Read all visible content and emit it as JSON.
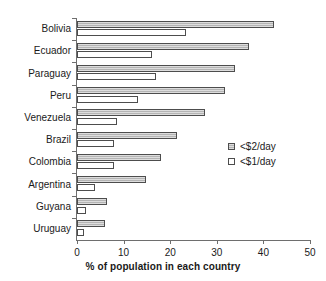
{
  "chart_data": {
    "type": "bar",
    "orientation": "horizontal",
    "title": "",
    "xlabel": "% of population in each country",
    "ylabel": "",
    "xlim": [
      0,
      50
    ],
    "xticks": [
      0,
      10,
      20,
      30,
      40,
      50
    ],
    "grid": false,
    "legend_position": "right-middle",
    "categories": [
      "Bolivia",
      "Ecuador",
      "Paraguay",
      "Peru",
      "Venezuela",
      "Brazil",
      "Colombia",
      "Argentina",
      "Guyana",
      "Uruguay"
    ],
    "series": [
      {
        "name": "<$2/day",
        "color": "#b4b4b4",
        "values": [
          42.3,
          37.0,
          34.0,
          31.8,
          27.5,
          21.5,
          18.0,
          14.8,
          6.5,
          6.0
        ]
      },
      {
        "name": "<$1/day",
        "color": "#ffffff",
        "values": [
          23.4,
          16.2,
          17.0,
          13.0,
          8.6,
          8.0,
          7.9,
          3.8,
          2.0,
          1.6
        ]
      }
    ]
  }
}
